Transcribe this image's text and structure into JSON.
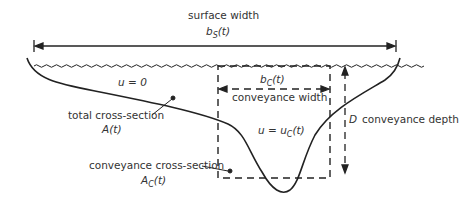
{
  "diagram": {
    "type": "channel cross-section",
    "labels": {
      "surface_width": "surface width",
      "surface_width_symbol": "b",
      "surface_width_sub": "S",
      "surface_width_arg": "(t)",
      "u_zero": "u = 0",
      "total_cross_section": "total cross-section",
      "total_cross_section_symbol": "A(t)",
      "conveyance_width_symbol": "b",
      "conveyance_width_sub": "C",
      "conveyance_width_arg": "(t)",
      "conveyance_width": "conveyance width",
      "u_conveyance_prefix": "u = u",
      "u_conveyance_sub": "C",
      "u_conveyance_arg": "(t)",
      "depth_symbol": "D",
      "conveyance_depth": "conveyance depth",
      "conveyance_cross_section": "conveyance cross-section",
      "conveyance_cross_section_symbol": "A",
      "conveyance_cross_section_sub": "C",
      "conveyance_cross_section_arg": "(t)"
    },
    "colors": {
      "line": "#222222",
      "text": "#333333",
      "background": "#ffffff"
    }
  }
}
